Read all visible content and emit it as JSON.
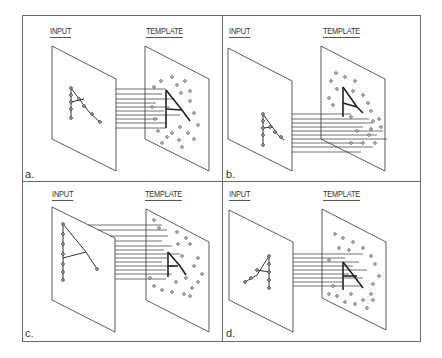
{
  "figure": {
    "panels": [
      {
        "id": "a",
        "tag": "a.",
        "input_label": "INPUT",
        "template_label": "TEMPLATE",
        "description": "Input A centered, aligned with template A"
      },
      {
        "id": "b",
        "tag": "b.",
        "input_label": "INPUT",
        "template_label": "TEMPLATE",
        "description": "Input A shifted down, misaligned with template"
      },
      {
        "id": "c",
        "tag": "c.",
        "input_label": "INPUT",
        "template_label": "TEMPLATE",
        "description": "Input A larger in size than template"
      },
      {
        "id": "d",
        "tag": "d.",
        "input_label": "INPUT",
        "template_label": "TEMPLATE",
        "description": "Input A rotated / slanted relative to template"
      }
    ],
    "colors": {
      "line": "#333333",
      "frame": "#6a6a6a",
      "background": "#ffffff"
    }
  }
}
